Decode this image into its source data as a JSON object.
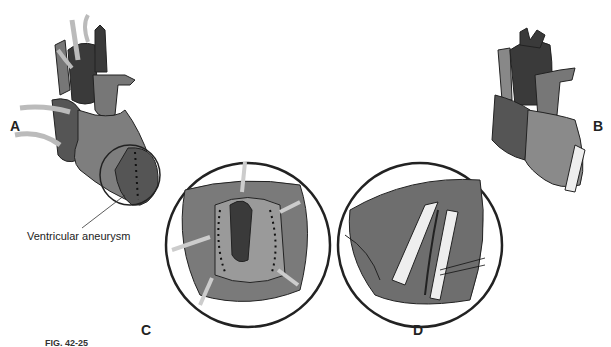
{
  "figure": {
    "panels": {
      "A": {
        "label": "A",
        "annotation": "Ventricular aneurysm"
      },
      "B": {
        "label": "B"
      },
      "C": {
        "label": "C"
      },
      "D": {
        "label": "D"
      }
    },
    "caption": "FIG. 42-25"
  },
  "colors": {
    "dark": "#3a3a3a",
    "mid": "#6e6e6e",
    "light": "#9a9a9a",
    "tube": "#e6e6e6",
    "stroke": "#222222"
  }
}
